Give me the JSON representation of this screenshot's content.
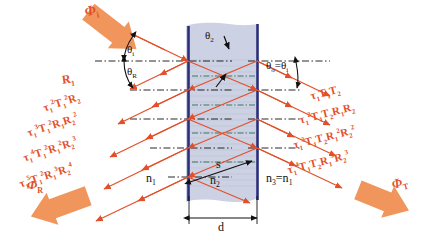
{
  "figure": {
    "colors": {
      "ray": "#e2502a",
      "arrow_fill": "#f0965c",
      "film_fill": "#c3c9de",
      "interface": "#2b2f7a",
      "axis": "#111111",
      "label_text": "#e2502a",
      "plain_text": "#111111"
    }
  },
  "fluxes": {
    "incident": "Φ",
    "incident_sub": "i",
    "reflected": "Φ",
    "reflected_sub": "R",
    "transmitted": "Φ",
    "transmitted_sub": "T"
  },
  "angles": {
    "incidence": "θ",
    "incidence_sub": "i",
    "reflection": "θ",
    "reflection_sub": "R",
    "refraction": "θ",
    "refraction_sub": "2",
    "exit_eq": "θ",
    "exit_sub": "o",
    "exit_rhs": "=θ",
    "exit_rhs_sub": "i"
  },
  "media": {
    "n1": "n",
    "n1_sub": "1",
    "n2": "n",
    "n2_sub": "2",
    "n3_eq": "n",
    "n3_sub": "3",
    "n3_rhs": "=n",
    "n3_rhs_sub": "1"
  },
  "geometry": {
    "thickness": "d",
    "path": "s"
  },
  "reflected_labels": [
    {
      "text": "R",
      "sub": "1",
      "pre": "",
      "full": "R₁"
    },
    {
      "text": "τ₁²T₁²R₂",
      "full": "τ₁²T₁²R₂"
    },
    {
      "text": "τ₁³T₁²R₁R₂²",
      "full": "τ₁³T₁²R₁R₂²"
    },
    {
      "text": "τ₁⁴T₁²R₁²R₂³",
      "full": "τ₁⁴T₁²R₁²R₂³"
    },
    {
      "text": "τ₁⁵T₁²R₁³R₂⁴",
      "full": "τ₁⁵T₁²R₁³R₂⁴"
    }
  ],
  "reflected_parts": [
    {
      "tau": "",
      "tau_exp": "",
      "T": "",
      "T_exp": "",
      "R1": "R",
      "R1_sub": "1",
      "R1_exp": "",
      "R2": "",
      "R2_exp": ""
    },
    {
      "tau": "τ",
      "tau_sub": "1",
      "tau_exp": "2",
      "T": "T",
      "T_sub": "1",
      "T_exp": "2",
      "R1": "",
      "R2": "R",
      "R2_sub": "2",
      "R2_exp": ""
    },
    {
      "tau": "τ",
      "tau_sub": "1",
      "tau_exp": "3",
      "T": "T",
      "T_sub": "1",
      "T_exp": "2",
      "R1": "R",
      "R1_sub": "1",
      "R1_exp": "",
      "R2": "R",
      "R2_sub": "2",
      "R2_exp": "2"
    },
    {
      "tau": "τ",
      "tau_sub": "1",
      "tau_exp": "4",
      "T": "T",
      "T_sub": "1",
      "T_exp": "2",
      "R1": "R",
      "R1_sub": "1",
      "R1_exp": "2",
      "R2": "R",
      "R2_sub": "2",
      "R2_exp": "3"
    },
    {
      "tau": "τ",
      "tau_sub": "1",
      "tau_exp": "5",
      "T": "T",
      "T_sub": "1",
      "T_exp": "2",
      "R1": "R",
      "R1_sub": "1",
      "R1_exp": "3",
      "R2": "R",
      "R2_sub": "2",
      "R2_exp": "4"
    }
  ],
  "transmitted_parts": [
    {
      "tau": "τ",
      "tau_sub": "1",
      "tau_exp": "",
      "T1": "T",
      "T1_sub": "1",
      "T1_exp": "",
      "T2": "T",
      "T2_sub": "2",
      "T2_exp": "",
      "R1": "",
      "R2": ""
    },
    {
      "tau": "τ",
      "tau_sub": "1",
      "tau_exp": "2",
      "T1": "T",
      "T1_sub": "1",
      "T1_exp": "",
      "T2": "T",
      "T2_sub": "2",
      "T2_exp": "",
      "R1": "R",
      "R1_sub": "1",
      "R1_exp": "",
      "R2": "R",
      "R2_sub": "2",
      "R2_exp": ""
    },
    {
      "tau": "τ",
      "tau_sub": "1",
      "tau_exp": "3",
      "T1": "T",
      "T1_sub": "1",
      "T1_exp": "",
      "T2": "T",
      "T2_sub": "2",
      "T2_exp": "",
      "R1": "R",
      "R1_sub": "1",
      "R1_exp": "2",
      "R2": "R",
      "R2_sub": "2",
      "R2_exp": "2"
    },
    {
      "tau": "τ",
      "tau_sub": "1",
      "tau_exp": "4",
      "T1": "T",
      "T1_sub": "1",
      "T1_exp": "",
      "T2": "T",
      "T2_sub": "2",
      "T2_exp": "",
      "R1": "R",
      "R1_sub": "1",
      "R1_exp": "3",
      "R2": "R",
      "R2_sub": "2",
      "R2_exp": "3"
    }
  ],
  "transmitted_labels": [
    {
      "full": "τ₁T₁T₂"
    },
    {
      "full": "τ₁²T₁T₂R₁R₂"
    },
    {
      "full": "τ₁³T₁T₂R₁²R₂²"
    },
    {
      "full": "τ₁⁴T₁T₂R₁³R₂³"
    }
  ]
}
